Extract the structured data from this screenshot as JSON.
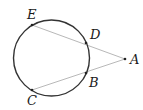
{
  "diagram": {
    "type": "geometry",
    "circle": {
      "cx": 51.5,
      "cy": 58,
      "r": 38
    },
    "points": [
      {
        "id": "E",
        "label": "E",
        "x": 32,
        "y": 25,
        "lx": 27,
        "ly": 19
      },
      {
        "id": "D",
        "label": "D",
        "x": 86,
        "y": 43,
        "lx": 90,
        "ly": 39
      },
      {
        "id": "A",
        "label": "A",
        "x": 125,
        "y": 59,
        "lx": 130,
        "ly": 64
      },
      {
        "id": "B",
        "label": "B",
        "x": 86,
        "y": 73,
        "lx": 89,
        "ly": 87
      },
      {
        "id": "C",
        "label": "C",
        "x": 32,
        "y": 90,
        "lx": 27,
        "ly": 105
      }
    ],
    "segments": [
      {
        "from": "E",
        "to": "A"
      },
      {
        "from": "C",
        "to": "A"
      }
    ],
    "colors": {
      "circle": "#333333",
      "segment": "#b8b8b8",
      "point": "#222222"
    }
  }
}
